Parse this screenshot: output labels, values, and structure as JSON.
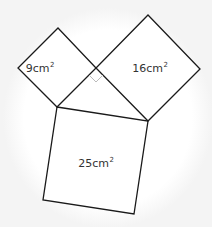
{
  "diagram": {
    "squares": [
      {
        "id": "small",
        "area_value": "9",
        "unit": "cm",
        "exponent": "2",
        "label_pos": [
          40,
          68
        ],
        "points": "58,28 96,68 57,107 18,68"
      },
      {
        "id": "medium",
        "area_value": "16",
        "unit": "cm",
        "exponent": "2",
        "label_pos": [
          150,
          68
        ],
        "points": "148,15 200,69 148,121 96,68"
      },
      {
        "id": "large",
        "area_value": "25",
        "unit": "cm",
        "exponent": "2",
        "label_pos": [
          96,
          163
        ],
        "points": "57,107 148,121 134,214 43,200"
      }
    ],
    "right_angle_marker": {
      "points": "96,68 103,75 96,82 89,75",
      "color": "#bbbbbb"
    },
    "stroke_color": "#1a1a1a",
    "fill_color": "#ffffff"
  }
}
